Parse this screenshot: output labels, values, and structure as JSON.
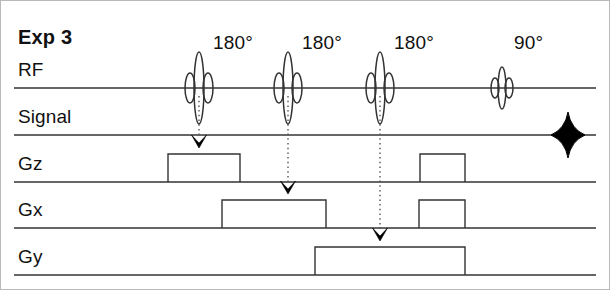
{
  "figure": {
    "title": "Exp 3",
    "type": "mri-pulse-sequence-diagram",
    "width": 610,
    "height": 290,
    "background_color": "#ffffff",
    "line_color": "#333333",
    "text_color": "#111111"
  },
  "rows": [
    {
      "label": "RF",
      "baseline_y": 88,
      "label_x": 18,
      "label_y": 78,
      "line_x1": 14,
      "line_x2": 596
    },
    {
      "label": "Signal",
      "baseline_y": 135,
      "label_x": 18,
      "label_y": 125,
      "line_x1": 14,
      "line_x2": 596
    },
    {
      "label": "Gz",
      "baseline_y": 182,
      "label_x": 18,
      "label_y": 172,
      "line_x1": 14,
      "line_x2": 596
    },
    {
      "label": "Gx",
      "baseline_y": 228,
      "label_x": 18,
      "label_y": 218,
      "line_x1": 14,
      "line_x2": 596
    },
    {
      "label": "Gy",
      "baseline_y": 275,
      "label_x": 18,
      "label_y": 265,
      "line_x1": 14,
      "line_x2": 596
    }
  ],
  "rf_pulses": [
    {
      "name": "pulse-180-1",
      "angle_label": "180°",
      "center_x": 199,
      "label_x": 213,
      "label_y": 50,
      "tall_half_height": 36,
      "tall_half_width": 5,
      "side_half_height": 15,
      "side_half_width": 5,
      "side_offset": 9
    },
    {
      "name": "pulse-180-2",
      "angle_label": "180°",
      "center_x": 288,
      "label_x": 302,
      "label_y": 50,
      "tall_half_height": 36,
      "tall_half_width": 5,
      "side_half_height": 15,
      "side_half_width": 5,
      "side_offset": 9
    },
    {
      "name": "pulse-180-3",
      "angle_label": "180°",
      "center_x": 380,
      "label_x": 394,
      "label_y": 50,
      "tall_half_height": 36,
      "tall_half_width": 5,
      "side_half_height": 15,
      "side_half_width": 5,
      "side_offset": 9
    },
    {
      "name": "pulse-90",
      "angle_label": "90°",
      "center_x": 502,
      "label_x": 514,
      "label_y": 50,
      "tall_half_height": 21,
      "tall_half_width": 4,
      "side_half_height": 10,
      "side_half_width": 4,
      "side_offset": 7
    }
  ],
  "echo_signal": {
    "name": "echo-diamond",
    "center_x": 568,
    "center_y": 135,
    "half_width": 17,
    "half_height": 23,
    "color": "#000000"
  },
  "gradient_pulses": [
    {
      "name": "gz-pulse-1",
      "row": "Gz",
      "x1": 168,
      "x2": 240,
      "baseline_y": 182,
      "height": 28
    },
    {
      "name": "gz-pulse-2",
      "row": "Gz",
      "x1": 420,
      "x2": 465,
      "baseline_y": 182,
      "height": 28
    },
    {
      "name": "gx-pulse-1",
      "row": "Gx",
      "x1": 222,
      "x2": 326,
      "baseline_y": 228,
      "height": 28
    },
    {
      "name": "gx-pulse-2",
      "row": "Gx",
      "x1": 419,
      "x2": 465,
      "baseline_y": 228,
      "height": 28
    },
    {
      "name": "gy-pulse-1",
      "row": "Gy",
      "x1": 315,
      "x2": 465,
      "baseline_y": 275,
      "height": 28
    }
  ],
  "connectors": [
    {
      "name": "connector-rf1-to-gz",
      "x": 199,
      "y1": 96,
      "y2": 148,
      "style": "dotted",
      "arrow": true
    },
    {
      "name": "connector-rf2-to-gx",
      "x": 288,
      "y1": 96,
      "y2": 194,
      "style": "dotted",
      "arrow": true
    },
    {
      "name": "connector-rf3-to-gy",
      "x": 380,
      "y1": 96,
      "y2": 241,
      "style": "dotted",
      "arrow": true
    }
  ]
}
